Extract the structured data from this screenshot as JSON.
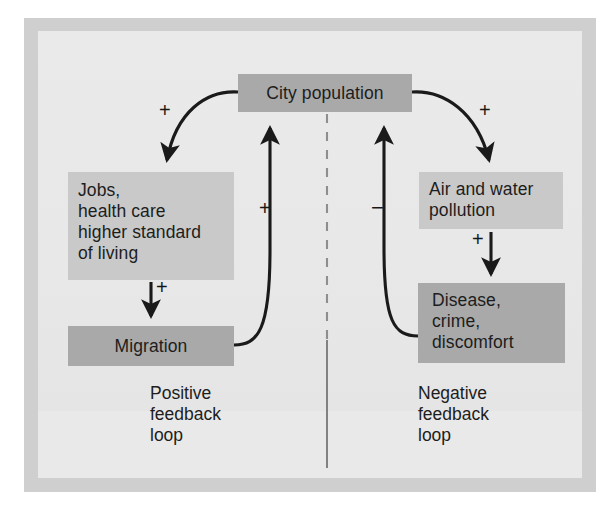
{
  "diagram": {
    "title_present": false,
    "nodes": [
      {
        "id": "city_population",
        "label": "City population",
        "shade": "#a9a9a9"
      },
      {
        "id": "jobs",
        "label": "Jobs,\nhealth care\nhigher standard\nof living",
        "shade": "#c9c9c9"
      },
      {
        "id": "migration",
        "label": "Migration",
        "shade": "#a9a9a9"
      },
      {
        "id": "pollution",
        "label": "Air and water\npollution",
        "shade": "#c9c9c9"
      },
      {
        "id": "disease",
        "label": "Disease,\ncrime,\ndiscomfort",
        "shade": "#a9a9a9"
      }
    ],
    "node_labels": {
      "city_population": "City population",
      "jobs": "Jobs,\nhealth care\nhigher standard\nof living",
      "migration": "Migration",
      "pollution": "Air and water\npollution",
      "disease": "Disease,\ncrime,\ndiscomfort"
    },
    "edges": [
      {
        "id": "city_to_jobs",
        "from": "city_population",
        "to": "jobs",
        "sign": "+",
        "style": "curved"
      },
      {
        "id": "jobs_to_migration",
        "from": "jobs",
        "to": "migration",
        "sign": "+",
        "style": "straight"
      },
      {
        "id": "migration_to_city",
        "from": "migration",
        "to": "city_population",
        "sign": "+",
        "style": "curved"
      },
      {
        "id": "city_to_pollution",
        "from": "city_population",
        "to": "pollution",
        "sign": "+",
        "style": "curved"
      },
      {
        "id": "pollution_to_disease",
        "from": "pollution",
        "to": "disease",
        "sign": "+",
        "style": "straight"
      },
      {
        "id": "disease_to_city",
        "from": "disease",
        "to": "city_population",
        "sign": "−",
        "style": "curved"
      }
    ],
    "edge_signs": {
      "city_to_jobs": "+",
      "jobs_to_migration": "+",
      "migration_to_city": "+",
      "city_to_pollution": "+",
      "pollution_to_disease": "+",
      "disease_to_city": "−"
    },
    "captions": {
      "positive_loop": "Positive\nfeedback\nloop",
      "negative_loop": "Negative\nfeedback\nloop"
    },
    "divider": {
      "name": "center-divider",
      "upper_style": "dashed",
      "lower_style": "solid"
    },
    "colors": {
      "frame": "#cfcfcf",
      "panel": "#e9e9e9",
      "node_dark": "#a9a9a9",
      "node_light": "#c9c9c9",
      "ink": "#1d1d1d",
      "page": "#ffffff"
    }
  }
}
